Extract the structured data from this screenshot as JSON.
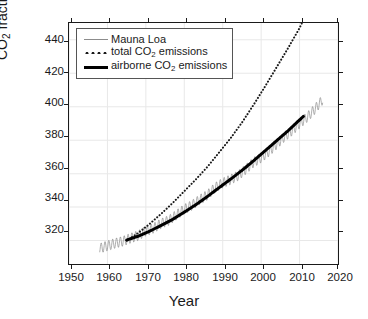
{
  "chart_data": {
    "type": "line",
    "title": "",
    "xlabel": "Year",
    "ylabel": "CO2 fraction (ppmv)",
    "ylabel_parts": {
      "pre": "CO",
      "sub": "2",
      "post": " fraction (ppmv)"
    },
    "xlim": [
      1950,
      2020
    ],
    "ylim": [
      306,
      450
    ],
    "xticks": [
      1950,
      1960,
      1970,
      1980,
      1990,
      2000,
      2010,
      2020
    ],
    "yticks": [
      320,
      340,
      360,
      380,
      400,
      420,
      440
    ],
    "grid": true,
    "grid_color": "#e8e8e8",
    "legend_position": "upper left",
    "series": [
      {
        "name": "Mauna Loa",
        "style": "thin-sawtooth",
        "color": "#8c8c8c",
        "seasonal_amplitude_ppmv": 6,
        "x": [
          1958,
          1960,
          1962,
          1964,
          1966,
          1968,
          1970,
          1972,
          1974,
          1976,
          1978,
          1980,
          1982,
          1984,
          1986,
          1988,
          1990,
          1992,
          1994,
          1996,
          1998,
          2000,
          2002,
          2004,
          2006,
          2008,
          2010,
          2012,
          2014,
          2016
        ],
        "values": [
          315.3,
          316.9,
          318.4,
          319.6,
          321.4,
          323.0,
          325.7,
          327.4,
          330.2,
          332.1,
          335.4,
          338.7,
          341.1,
          344.4,
          347.2,
          351.6,
          354.4,
          356.4,
          358.8,
          362.6,
          366.7,
          369.5,
          373.2,
          377.5,
          381.9,
          385.6,
          389.9,
          393.8,
          398.6,
          404.2
        ],
        "label": "Mauna Loa"
      },
      {
        "name": "total CO2 emissions",
        "style": "dotted",
        "color": "#1a1a1a",
        "x": [
          1965,
          1968,
          1971,
          1974,
          1977,
          1980,
          1983,
          1986,
          1989,
          1992,
          1995,
          1998,
          2001,
          2004,
          2007,
          2010,
          2011
        ],
        "values": [
          320.0,
          324.5,
          330.0,
          336.0,
          342.5,
          349.5,
          356.5,
          364.0,
          372.5,
          381.0,
          390.5,
          401.0,
          412.0,
          423.5,
          435.0,
          447.0,
          452.0
        ],
        "label": "total CO2 emissions",
        "label_parts": {
          "pre": "total CO",
          "sub": "2",
          "post": " emissions"
        }
      },
      {
        "name": "airborne CO2 emissions",
        "style": "thick",
        "color": "#000000",
        "x": [
          1965,
          1968,
          1971,
          1974,
          1977,
          1980,
          1983,
          1986,
          1989,
          1992,
          1995,
          1998,
          2001,
          2004,
          2007,
          2010,
          2011
        ],
        "values": [
          320.3,
          322.6,
          325.6,
          329.1,
          332.7,
          337.0,
          341.4,
          346.3,
          351.5,
          356.6,
          361.9,
          367.6,
          373.6,
          379.6,
          385.6,
          392.1,
          394.2
        ],
        "label": "airborne CO2 emissions",
        "label_parts": {
          "pre": "airborne CO",
          "sub": "2",
          "post": " emissions"
        }
      }
    ]
  },
  "axes": {
    "x_title": "Year",
    "x_tick_labels": [
      "1950",
      "1960",
      "1970",
      "1980",
      "1990",
      "2000",
      "2010",
      "2020"
    ],
    "y_tick_labels": [
      "440",
      "420",
      "400",
      "380",
      "360",
      "340",
      "320"
    ]
  },
  "legend": {
    "entries": [
      {
        "key": "thin-line",
        "text": "Mauna Loa"
      },
      {
        "key": "dotted-line",
        "text": "total CO2 emissions"
      },
      {
        "key": "thick-line",
        "text": "airborne CO2 emissions"
      }
    ]
  }
}
